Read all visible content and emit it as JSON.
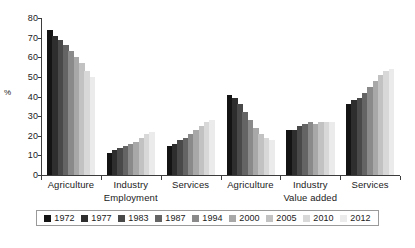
{
  "chart_data": {
    "type": "bar",
    "title": "",
    "xlabel": "",
    "ylabel": "%",
    "ylim": [
      0,
      80
    ],
    "yticks": [
      0,
      10,
      20,
      30,
      40,
      50,
      60,
      70,
      80
    ],
    "grid": false,
    "legend_position": "bottom",
    "categories": [
      "Agriculture",
      "Industry",
      "Services",
      "Agriculture",
      "Industry",
      "Services"
    ],
    "panels": [
      {
        "label": "Employment",
        "categories": [
          "Agriculture",
          "Industry",
          "Services"
        ]
      },
      {
        "label": "Value added",
        "categories": [
          "Agriculture",
          "Industry",
          "Services"
        ]
      }
    ],
    "series": [
      {
        "name": "1972",
        "color": "#141414",
        "values": [
          74,
          11,
          15,
          41,
          23,
          36
        ]
      },
      {
        "name": "1977",
        "color": "#2e2e2e",
        "values": [
          71,
          13,
          16,
          39,
          23,
          38
        ]
      },
      {
        "name": "1983",
        "color": "#494949",
        "values": [
          69,
          14,
          18,
          36,
          25,
          39
        ]
      },
      {
        "name": "1987",
        "color": "#646464",
        "values": [
          66,
          15,
          19,
          32,
          26,
          42
        ]
      },
      {
        "name": "1994",
        "color": "#8a8a8a",
        "values": [
          63,
          16,
          21,
          28,
          27,
          45
        ]
      },
      {
        "name": "2000",
        "color": "#a8a8a8",
        "values": [
          60,
          17,
          23,
          24,
          26,
          48
        ]
      },
      {
        "name": "2005",
        "color": "#c2c2c2",
        "values": [
          57,
          19,
          25,
          21,
          27,
          51
        ]
      },
      {
        "name": "2010",
        "color": "#d8d8d8",
        "values": [
          53,
          21,
          27,
          19,
          27,
          53
        ]
      },
      {
        "name": "2012",
        "color": "#ebebeb",
        "values": [
          50,
          22,
          28,
          18,
          27,
          54
        ]
      }
    ]
  }
}
